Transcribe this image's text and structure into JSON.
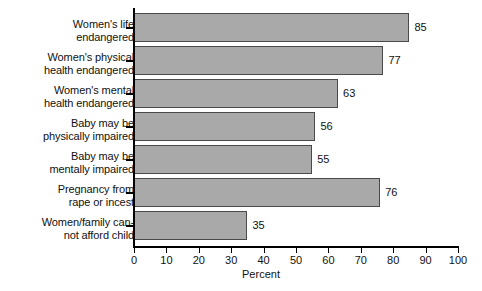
{
  "chart_data": {
    "type": "bar",
    "orientation": "horizontal",
    "title": "",
    "xlabel": "Percent",
    "ylabel": "",
    "xlim": [
      0,
      100
    ],
    "xticks": [
      0,
      10,
      20,
      30,
      40,
      50,
      60,
      70,
      80,
      90,
      100
    ],
    "grid": false,
    "legend": false,
    "bar_color": "#a9a9a9",
    "bar_edge_color": "#4a4a4a",
    "background_color": "#ffffff",
    "categories": [
      "Women's life\nendangered",
      "Women's physical\nhealth endangered",
      "Women's mental\nhealth endangered",
      "Baby may be\nphysically impaired",
      "Baby may be\nmentally impaired",
      "Pregnancy from\nrape or incest",
      "Women/family can-\nnot afford child"
    ],
    "values": [
      85,
      77,
      63,
      56,
      55,
      76,
      35
    ],
    "value_labels": [
      "85",
      "77",
      "63",
      "56",
      "55",
      "76",
      "35"
    ]
  }
}
